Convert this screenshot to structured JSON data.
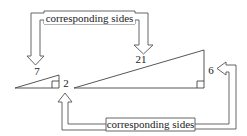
{
  "diagram": {
    "top_label": "corresponding sides",
    "bottom_label": "corresponding sides",
    "small_triangle": {
      "hypotenuse_label": "7",
      "leg_label": "2"
    },
    "large_triangle": {
      "hypotenuse_label": "21",
      "leg_label": "6"
    },
    "colors": {
      "stroke": "#444444",
      "background": "#ffffff"
    }
  }
}
